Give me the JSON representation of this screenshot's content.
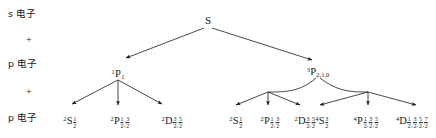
{
  "diagram": {
    "title": "S",
    "type": "term-symbol-splitting-tree",
    "line_color": "#1a1a1a",
    "background": "#ffffff"
  },
  "side_labels": [
    {
      "id": "s-electron",
      "text": "s 电子",
      "kind": "electron"
    },
    {
      "id": "plus-1",
      "text": "+",
      "kind": "operator"
    },
    {
      "id": "p-electron-1",
      "text": "p 电子",
      "kind": "electron"
    },
    {
      "id": "plus-2",
      "text": "+",
      "kind": "operator"
    },
    {
      "id": "p-electron-2",
      "text": "p 电子",
      "kind": "electron"
    }
  ],
  "root": {
    "label": "S"
  },
  "level2": [
    {
      "id": "singlet-P1",
      "multiplicity": "1",
      "letter": "P",
      "j_plain": "1",
      "display": "1P1"
    },
    {
      "id": "triplet-P210",
      "multiplicity": "3",
      "letter": "P",
      "j_plain": "2,1,0",
      "display": "3P2,1,0"
    }
  ],
  "level3": [
    {
      "id": "doublet-S-half",
      "multiplicity": "2",
      "letter": "S",
      "j_fractions": [
        {
          "num": "1",
          "den": "2"
        }
      ]
    },
    {
      "id": "doublet-P-half-3half",
      "multiplicity": "2",
      "letter": "P",
      "j_fractions": [
        {
          "num": "1",
          "den": "2"
        },
        {
          "num": "3",
          "den": "2"
        }
      ]
    },
    {
      "id": "doublet-D-3half-5half",
      "multiplicity": "2",
      "letter": "D",
      "j_fractions": [
        {
          "num": "3",
          "den": "2"
        },
        {
          "num": "5",
          "den": "2"
        }
      ]
    },
    {
      "id": "doublet-S-half-b",
      "multiplicity": "2",
      "letter": "S",
      "j_fractions": [
        {
          "num": "1",
          "den": "2"
        }
      ]
    },
    {
      "id": "doublet-P-half-3half-b",
      "multiplicity": "2",
      "letter": "P",
      "j_fractions": [
        {
          "num": "1",
          "den": "2"
        },
        {
          "num": "3",
          "den": "2"
        }
      ]
    },
    {
      "id": "doublet-D-3half-5half-b",
      "multiplicity": "2",
      "letter": "D",
      "j_fractions": [
        {
          "num": "3",
          "den": "2"
        },
        {
          "num": "5",
          "den": "2"
        }
      ]
    },
    {
      "id": "quartet-S-3half",
      "multiplicity": "4",
      "letter": "S",
      "j_fractions": [
        {
          "num": "3",
          "den": "2"
        }
      ]
    },
    {
      "id": "quartet-P-half-3half-5half",
      "multiplicity": "4",
      "letter": "P",
      "j_fractions": [
        {
          "num": "1",
          "den": "2"
        },
        {
          "num": "3",
          "den": "2"
        },
        {
          "num": "5",
          "den": "2"
        }
      ]
    },
    {
      "id": "quartet-D-half-3half-5half-7half",
      "multiplicity": "4",
      "letter": "D",
      "j_fractions": [
        {
          "num": "1",
          "den": "2"
        },
        {
          "num": "3",
          "den": "2"
        },
        {
          "num": "5",
          "den": "2"
        },
        {
          "num": "7",
          "den": "2"
        }
      ]
    }
  ]
}
